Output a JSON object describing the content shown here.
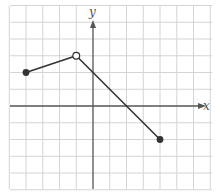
{
  "chart_data": {
    "type": "line",
    "title": "",
    "xlabel": "x",
    "ylabel": "y",
    "xlim": [
      -5,
      7
    ],
    "ylim": [
      -5,
      6
    ],
    "grid": true,
    "grid_step": 1,
    "tick_labels": false,
    "series": [
      {
        "name": "segment-1",
        "points": [
          [
            -4,
            2
          ],
          [
            -1,
            3
          ]
        ],
        "endpoints": [
          {
            "x": -4,
            "y": 2,
            "style": "closed"
          },
          {
            "x": -1,
            "y": 3,
            "style": "open"
          }
        ]
      },
      {
        "name": "segment-2",
        "points": [
          [
            -1,
            3
          ],
          [
            4,
            -2
          ]
        ],
        "endpoints": [
          {
            "x": -1,
            "y": 3,
            "style": "open"
          },
          {
            "x": 4,
            "y": -2,
            "style": "closed"
          }
        ]
      }
    ],
    "colors": {
      "grid": "#d4d4d4",
      "axis": "#555555",
      "curve": "#333333",
      "point_fill": "#333333",
      "open_point_fill": "#ffffff"
    }
  },
  "labels": {
    "x_axis": "x",
    "y_axis": "y"
  }
}
